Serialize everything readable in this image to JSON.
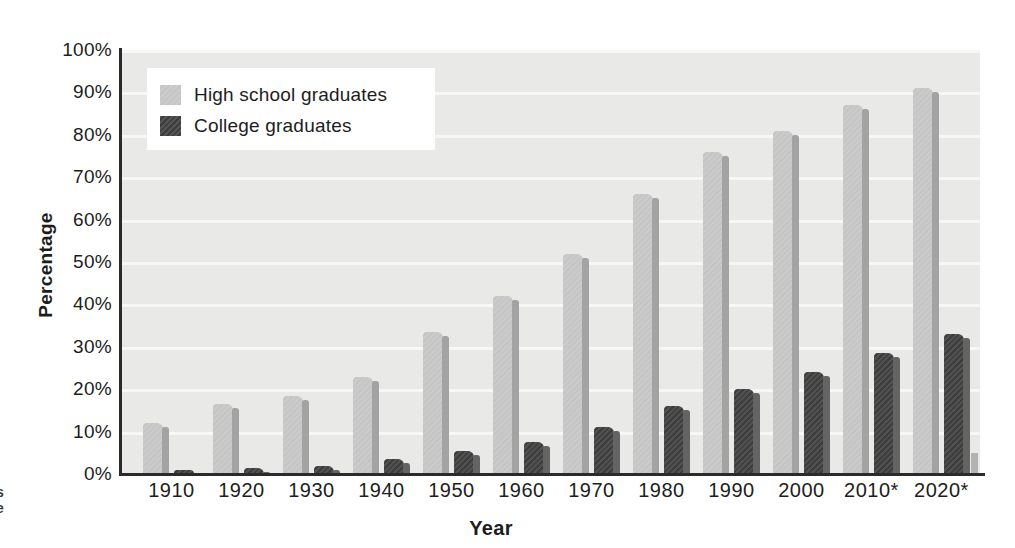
{
  "page": {
    "background": "#ffffff",
    "edge_fragments": [
      "s",
      "e"
    ]
  },
  "chart_data": {
    "type": "bar",
    "title": "",
    "xlabel": "Year",
    "ylabel": "Percentage",
    "categories": [
      "1910",
      "1920",
      "1930",
      "1940",
      "1950",
      "1960",
      "1970",
      "1980",
      "1990",
      "2000",
      "2010*",
      "2020*"
    ],
    "series": [
      {
        "name": "High school graduates",
        "color": "#c5c5c5",
        "side_shadow_color": "#a3a3a3",
        "values": [
          12,
          16.5,
          18.5,
          23,
          33.5,
          42,
          52,
          66,
          76,
          81,
          87,
          91
        ]
      },
      {
        "name": "College graduates",
        "color": "#3d3d3d",
        "side_shadow_color": "#646464",
        "values": [
          1,
          1.5,
          2,
          3.5,
          5.5,
          7.5,
          11,
          16,
          20,
          24,
          28.5,
          33
        ]
      }
    ],
    "ylim": [
      0,
      100
    ],
    "ytick_interval": 10,
    "yticks": [
      "100%",
      "90%",
      "80%",
      "70%",
      "60%",
      "50%",
      "40%",
      "30%",
      "20%",
      "10%",
      "0%"
    ],
    "grid": "horizontal gridlines every 10%",
    "gridline_color": "#f7f7f5",
    "plot_background": "#e9e9e7",
    "axis_color": "#2b2b2b",
    "text_color": "#1d1d1d",
    "legend_background": "#ffffff",
    "legend_position": "top-left"
  }
}
